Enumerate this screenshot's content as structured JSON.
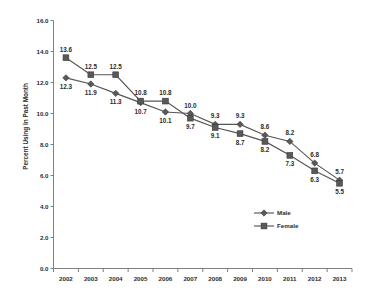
{
  "chart_data": {
    "type": "line",
    "title": "",
    "xlabel": "",
    "ylabel": "Percent Using In Past Month",
    "categories": [
      "2002",
      "2003",
      "2004",
      "2005",
      "2006",
      "2007",
      "2008",
      "2009",
      "2010",
      "2011",
      "2012",
      "2013"
    ],
    "ylim": [
      0.0,
      16.0
    ],
    "ytick_labels": [
      "0.0",
      "2.0",
      "4.0",
      "6.0",
      "8.0",
      "10.0",
      "12.0",
      "14.0",
      "16.0"
    ],
    "ytick_values": [
      0.0,
      2.0,
      4.0,
      6.0,
      8.0,
      10.0,
      12.0,
      14.0,
      16.0
    ],
    "grid": false,
    "legend_position": "inside-lower-right",
    "series": [
      {
        "name": "Male",
        "marker": "diamond",
        "color": "#595959",
        "values": [
          12.3,
          11.9,
          11.3,
          10.7,
          10.1,
          10.0,
          9.3,
          9.3,
          8.6,
          8.2,
          6.8,
          5.7
        ],
        "labels": [
          "12.3",
          "11.9",
          "11.3",
          "10.7",
          "10.1",
          "10.0",
          "9.3",
          "9.3",
          "8.6",
          "8.2",
          "6.8",
          "5.7"
        ],
        "label_positions": [
          "below",
          "below",
          "below",
          "below",
          "below",
          "above",
          "above",
          "above",
          "above",
          "above",
          "above",
          "above"
        ]
      },
      {
        "name": "Female",
        "marker": "square",
        "color": "#595959",
        "values": [
          13.6,
          12.5,
          12.5,
          10.8,
          10.8,
          9.7,
          9.1,
          8.7,
          8.2,
          7.3,
          6.3,
          5.5
        ],
        "labels": [
          "13.6",
          "12.5",
          "12.5",
          "10.8",
          "10.8",
          "9.7",
          "9.1",
          "8.7",
          "8.2",
          "7.3",
          "6.3",
          "5.5"
        ],
        "label_positions": [
          "above",
          "above",
          "above",
          "above",
          "above",
          "below",
          "below",
          "below",
          "below",
          "below",
          "below",
          "below"
        ]
      }
    ]
  },
  "legend": {
    "entries": [
      {
        "label": "Male",
        "marker": "diamond"
      },
      {
        "label": "Female",
        "marker": "square"
      }
    ]
  },
  "axis": {
    "y_title": "Percent Using In Past Month"
  }
}
